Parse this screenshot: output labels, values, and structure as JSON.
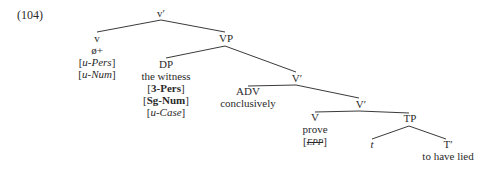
{
  "example_number": "(104)",
  "nodes": {
    "vbar": {
      "label": "v′"
    },
    "v": {
      "label": "v",
      "lines": [
        "ø+"
      ],
      "features": [
        {
          "prefix": "u-",
          "name": "Pers"
        },
        {
          "prefix": "u-",
          "name": "Num"
        }
      ]
    },
    "VP": {
      "label": "VP"
    },
    "DP": {
      "label": "DP",
      "lines": [
        "the witness"
      ],
      "features_bold": [
        "3-Pers",
        "Sg-Num"
      ],
      "features": [
        {
          "prefix": "u-",
          "name": "Case"
        }
      ]
    },
    "Vbar1": {
      "label": "V′"
    },
    "ADV": {
      "label": "ADV",
      "lines": [
        "conclusively"
      ]
    },
    "Vbar2": {
      "label": "V′"
    },
    "V": {
      "label": "V",
      "lines": [
        "prove"
      ],
      "struck_feature": "EPP"
    },
    "TP": {
      "label": "TP"
    },
    "t": {
      "label": "t"
    },
    "Tbar": {
      "label": "T′",
      "lines": [
        "to have lied"
      ]
    }
  }
}
